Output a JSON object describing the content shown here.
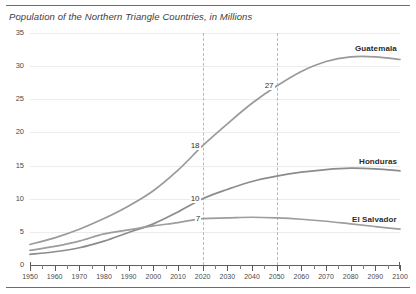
{
  "figure": {
    "title": "Population of the Northern Triangle Countries, in Millions"
  },
  "chart_data": {
    "type": "line",
    "title": "Population of the Northern Triangle Countries, in Millions",
    "xlabel": "",
    "ylabel": "",
    "xlim": [
      1950,
      2100
    ],
    "ylim": [
      0,
      35
    ],
    "grid": true,
    "legend_position": "inline-right",
    "yticks": [
      0,
      5,
      10,
      15,
      20,
      25,
      30,
      35
    ],
    "xticks": [
      1950,
      1960,
      1970,
      1980,
      1990,
      2000,
      2010,
      2020,
      2030,
      2040,
      2050,
      2060,
      2070,
      2080,
      2090,
      2100
    ],
    "x": [
      1950,
      1960,
      1970,
      1980,
      1990,
      2000,
      2010,
      2020,
      2030,
      2040,
      2050,
      2060,
      2070,
      2080,
      2090,
      2100
    ],
    "series": [
      {
        "name": "Guatemala",
        "color": "#9a9a9a",
        "values": [
          3.1,
          4.1,
          5.4,
          7.0,
          8.9,
          11.2,
          14.3,
          18.0,
          21.3,
          24.4,
          27.0,
          29.2,
          30.7,
          31.4,
          31.4,
          31.0
        ]
      },
      {
        "name": "Honduras",
        "color": "#8c8c8c",
        "values": [
          1.6,
          2.0,
          2.6,
          3.6,
          4.9,
          6.2,
          8.0,
          10.0,
          11.4,
          12.6,
          13.4,
          14.0,
          14.4,
          14.6,
          14.5,
          14.2
        ]
      },
      {
        "name": "El Salvador",
        "color": "#9d9d9d",
        "values": [
          2.2,
          2.8,
          3.6,
          4.7,
          5.3,
          5.9,
          6.4,
          7.0,
          7.1,
          7.2,
          7.1,
          6.9,
          6.6,
          6.2,
          5.8,
          5.4
        ]
      }
    ],
    "reference_lines": [
      {
        "x": 2020,
        "style": "dashed"
      },
      {
        "x": 2050,
        "style": "dashed"
      }
    ],
    "annotations": [
      {
        "text": "18",
        "x": 2020,
        "y": 18,
        "series": "Guatemala"
      },
      {
        "text": "27",
        "x": 2050,
        "y": 27,
        "series": "Guatemala"
      },
      {
        "text": "10",
        "x": 2020,
        "y": 10,
        "series": "Honduras"
      },
      {
        "text": "7",
        "x": 2020,
        "y": 7,
        "series": "El Salvador"
      }
    ]
  }
}
